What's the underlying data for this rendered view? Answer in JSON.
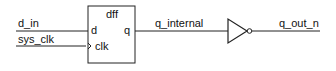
{
  "diagram": {
    "component": {
      "name": "dff",
      "ports": {
        "d": "d",
        "clk": "clk",
        "q": "q"
      }
    },
    "signals": {
      "d_in": "d_in",
      "sys_clk": "sys_clk",
      "q_internal": "q_internal",
      "q_out_n": "q_out_n"
    },
    "gate": "inverter",
    "colors": {
      "stroke": "#222222",
      "background": "#ffffff"
    }
  }
}
